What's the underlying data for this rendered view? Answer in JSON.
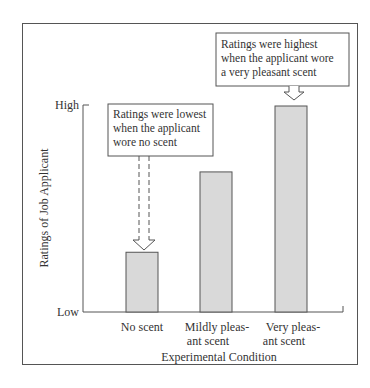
{
  "chart_data": {
    "type": "bar",
    "title": "",
    "xlabel": "Experimental Condition",
    "ylabel": "Ratings of Job Applicant",
    "y_tick_labels": [
      "Low",
      "High"
    ],
    "ylim": [
      0,
      100
    ],
    "y_scale_note": "qualitative axis (Low to High); values normalized 0-100",
    "categories": [
      "No scent",
      "Mildly pleasant scent",
      "Very pleasant scent"
    ],
    "category_label_lines": [
      [
        "No scent"
      ],
      [
        "Mildly pleas-",
        "ant scent"
      ],
      [
        "Very pleas-",
        "ant scent"
      ]
    ],
    "values": [
      29,
      68,
      100
    ],
    "grid": false,
    "legend": null,
    "bar_color": "#d9d9d9",
    "annotations": [
      {
        "target": "No scent",
        "lines": [
          "Ratings were lowest",
          "when the applicant",
          "wore no scent"
        ],
        "arrow": "dashed"
      },
      {
        "target": "Very pleasant scent",
        "lines": [
          "Ratings were highest",
          "when the applicant wore",
          "a very pleasant scent"
        ],
        "arrow": "solid"
      }
    ]
  }
}
